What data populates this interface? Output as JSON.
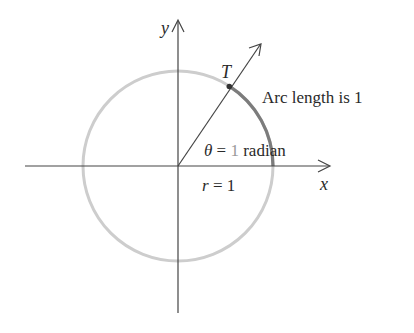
{
  "figure": {
    "labels": {
      "y_axis": "y",
      "x_axis": "x",
      "point": "T",
      "arc_note": "Arc length is 1",
      "theta_sym": "θ",
      "theta_eq": " = ",
      "theta_val": "1",
      "theta_unit": " radian",
      "r_sym": "r",
      "r_eq": " = 1"
    },
    "geometry": {
      "origin": [
        178,
        166
      ],
      "radius": 95,
      "angle_radians": 1
    },
    "colors": {
      "axes": "#3a3a3a",
      "circle": "#c8c8c8",
      "arc_highlight": "#7a7a7a",
      "text": "#2a2a2a",
      "theta_value": "#9a9a9a"
    }
  }
}
